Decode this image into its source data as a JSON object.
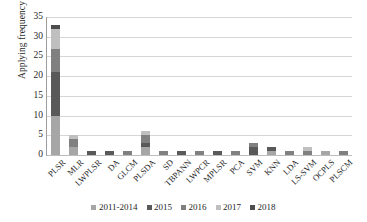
{
  "chart_data": {
    "type": "bar",
    "subtype": "stacked-column",
    "title": "",
    "xlabel": "",
    "ylabel": "Applying frequency",
    "ylim": [
      0,
      35
    ],
    "yticks": [
      0,
      5,
      10,
      15,
      20,
      25,
      30,
      35
    ],
    "grid": true,
    "legend_position": "bottom",
    "categories": [
      "PLSR",
      "MLR",
      "LWPLSR",
      "DA",
      "GLCM",
      "PLSDA",
      "SD",
      "TBPANN",
      "LWPCR",
      "MPLSR",
      "PCA",
      "SVM",
      "KNN",
      "LDA",
      "LS-SVM",
      "OCPLS",
      "PLSCM"
    ],
    "series": [
      {
        "name": "2011-2014",
        "color": "#a6a6a6",
        "values": [
          10,
          2,
          0,
          0,
          0,
          2,
          0,
          0,
          0,
          0,
          0,
          0,
          1,
          0,
          0,
          1,
          0
        ]
      },
      {
        "name": "2015",
        "color": "#595959",
        "values": [
          11,
          0,
          1,
          1,
          0,
          1,
          0,
          1,
          0,
          1,
          0,
          2,
          1,
          0,
          0,
          0,
          0
        ]
      },
      {
        "name": "2016",
        "color": "#808080",
        "values": [
          6,
          2,
          0,
          0,
          1,
          2,
          1,
          0,
          1,
          0,
          1,
          1,
          0,
          1,
          1,
          0,
          1
        ]
      },
      {
        "name": "2017",
        "color": "#bfbfbf",
        "values": [
          5,
          1,
          0,
          0,
          0,
          1,
          0,
          0,
          0,
          0,
          0,
          0,
          0,
          0,
          1,
          0,
          0
        ]
      },
      {
        "name": "2018",
        "color": "#4d4d4d",
        "values": [
          1,
          0,
          0,
          0,
          0,
          0,
          0,
          0,
          0,
          0,
          0,
          0,
          0,
          0,
          0,
          0,
          0
        ]
      }
    ],
    "totals": [
      33,
      5,
      1,
      1,
      1,
      6,
      1,
      1,
      1,
      1,
      1,
      3,
      2,
      1,
      2,
      1,
      1
    ]
  },
  "axis": {
    "y_title": "Applying frequency"
  },
  "colors": {
    "gridline": "#d6d6d6",
    "axis": "#9e9e9e",
    "text": "#1f1f1f",
    "background": "#ffffff"
  }
}
